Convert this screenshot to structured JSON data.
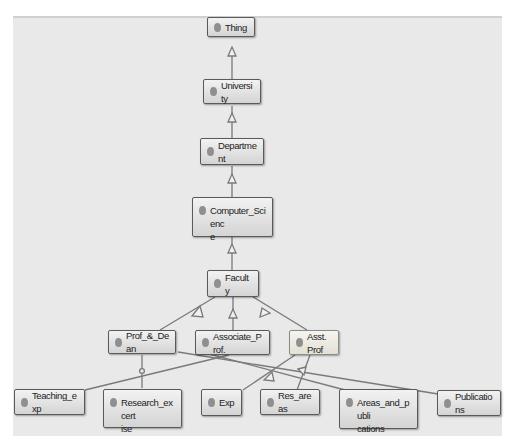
{
  "diagram": {
    "type": "ontology-class-hierarchy",
    "nodes": {
      "thing": {
        "label": "Thing"
      },
      "university": {
        "label": "University"
      },
      "department": {
        "label": "Department"
      },
      "computer_science": {
        "label": "Computer_Scienc\ne"
      },
      "faculty": {
        "label": "Faculty"
      },
      "prof_dean": {
        "label": "Prof_&_Dean"
      },
      "associate_prof": {
        "label": "Associate_Prof."
      },
      "asst_prof": {
        "label": "Asst.Prof"
      },
      "teaching_exp": {
        "label": "Teaching_exp"
      },
      "research_expertise": {
        "label": "Research_excert\nise"
      },
      "exp": {
        "label": "Exp"
      },
      "res_areas": {
        "label": "Res_areas"
      },
      "areas_publications": {
        "label": "Areas_and_publi\ncations"
      },
      "publications": {
        "label": "Publications"
      }
    },
    "edges": [
      {
        "from": "University",
        "to": "Thing",
        "type": "subclass-of"
      },
      {
        "from": "Department",
        "to": "University",
        "type": "subclass-of"
      },
      {
        "from": "Computer_Science",
        "to": "Department",
        "type": "subclass-of"
      },
      {
        "from": "Faculty",
        "to": "Computer_Science",
        "type": "subclass-of"
      },
      {
        "from": "Prof_&_Dean",
        "to": "Faculty",
        "type": "subclass-of"
      },
      {
        "from": "Associate_Prof.",
        "to": "Faculty",
        "type": "subclass-of"
      },
      {
        "from": "Asst.Prof",
        "to": "Faculty",
        "type": "subclass-of"
      },
      {
        "from": "Teaching_exp",
        "to": "Associate_Prof.",
        "type": "subclass-of"
      },
      {
        "from": "Research_excertise",
        "to": "Prof_&_Dean",
        "type": "subclass-of"
      },
      {
        "from": "Exp",
        "to": "Asst.Prof",
        "type": "subclass-of"
      },
      {
        "from": "Res_areas",
        "to": "Asst.Prof",
        "type": "subclass-of"
      },
      {
        "from": "Areas_and_publications",
        "to": "Associate_Prof.",
        "type": "subclass-of"
      },
      {
        "from": "Publications",
        "to": "Prof_&_Dean",
        "type": "subclass-of"
      }
    ],
    "colors": {
      "canvas": "#e9e9e9",
      "node_border": "#5a5a5a",
      "node_fill_top": "#f2f2f2",
      "node_fill_bottom": "#d4d4d4",
      "edge": "#7a7a7a",
      "dot": "#8f8f8f"
    }
  }
}
